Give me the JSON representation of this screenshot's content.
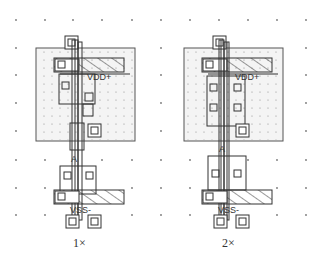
{
  "figure": {
    "layouts": [
      {
        "id": "inverter-1x",
        "caption": "1×",
        "supply_label": "VDD+",
        "ground_label": "VSS-",
        "input_label": "A"
      },
      {
        "id": "inverter-2x",
        "caption": "2×",
        "supply_label": "VDD+",
        "ground_label": "VSS-",
        "input_label": "A"
      }
    ],
    "colors": {
      "background": "#ffffff",
      "line": "#333333",
      "well_fill": "#f4f4f4",
      "grid_dot": "#777777"
    }
  }
}
